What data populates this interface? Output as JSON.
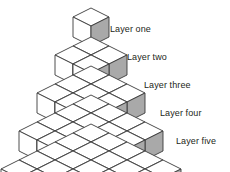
{
  "figure": {
    "type": "isometric-cube-diagram",
    "width": 230,
    "height": 172,
    "background": "#ffffff"
  },
  "cube_style": {
    "top_face_color": "#ffffff",
    "left_face_color": "#ffffff",
    "right_face_color": "#a9a9a9",
    "stroke_color": "#3a3a3a",
    "stroke_width": 0.9,
    "half_width": 18,
    "top_half_height": 9,
    "side_height": 20
  },
  "geometry": {
    "apex_x": 91,
    "apex_y": 17,
    "step_x": 18,
    "step_y": 9,
    "layer_drop": 29
  },
  "labels": [
    {
      "id": "layer-one",
      "text": "Layer one",
      "x": 110,
      "y": 24
    },
    {
      "id": "layer-two",
      "text": "Layer two",
      "x": 127,
      "y": 52
    },
    {
      "id": "layer-three",
      "text": "Layer three",
      "x": 144,
      "y": 80
    },
    {
      "id": "layer-four",
      "text": "Layer four",
      "x": 160,
      "y": 108
    },
    {
      "id": "layer-five",
      "text": "Layer five",
      "x": 176,
      "y": 136
    }
  ],
  "layers": [
    {
      "index": 1,
      "name": "Layer one",
      "cubes_visible": 1,
      "cubes_total": 1
    },
    {
      "index": 2,
      "name": "Layer two",
      "cubes_visible": 3,
      "cubes_total": 4
    },
    {
      "index": 3,
      "name": "Layer three",
      "cubes_visible": 5,
      "cubes_total": 9
    },
    {
      "index": 4,
      "name": "Layer four",
      "cubes_visible": 7,
      "cubes_total": 16
    },
    {
      "index": 5,
      "name": "Layer five",
      "cubes_visible": 9,
      "cubes_total": 25
    }
  ]
}
